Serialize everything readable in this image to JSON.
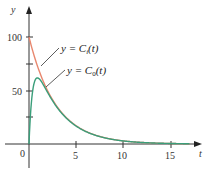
{
  "chart_data": {
    "type": "line",
    "title": "",
    "xlabel": "t",
    "ylabel": "y",
    "xlim": [
      0,
      17
    ],
    "ylim": [
      0,
      120
    ],
    "x_ticks": [
      0,
      5,
      10,
      15
    ],
    "y_ticks": [
      50,
      100
    ],
    "y_minor_ticks": [
      25,
      75
    ],
    "grid": false,
    "series": [
      {
        "name": "y = C_i(t)",
        "color": "#e8876e",
        "x": [
          0,
          1,
          2,
          3,
          4,
          5,
          6,
          8,
          10,
          12,
          15,
          17
        ],
        "values": [
          100,
          70,
          50,
          35,
          25,
          17,
          12,
          6,
          3,
          1.5,
          0.5,
          0.3
        ]
      },
      {
        "name": "y = C_0(t)",
        "color": "#3a9e7a",
        "x": [
          0,
          0.5,
          1,
          1.5,
          2,
          3,
          4,
          5,
          6,
          8,
          10,
          12,
          15,
          17
        ],
        "values": [
          0,
          50,
          60,
          55,
          47,
          33,
          24,
          16,
          12,
          6,
          3,
          1.5,
          0.5,
          0.3
        ]
      }
    ],
    "annotations": [
      "y = C_i(t)",
      "y = C_0(t)"
    ]
  },
  "labels": {
    "y_axis": "y",
    "x_axis": "t",
    "origin": "0",
    "y100": "100",
    "y50": "50",
    "x5": "5",
    "x10": "10",
    "x15": "15",
    "ci_prefix": "y = ",
    "ci_C": "C",
    "ci_sub": "i",
    "ci_suffix": "(t)",
    "c0_prefix": "y = ",
    "c0_C": "C",
    "c0_sub": "0",
    "c0_suffix": "(t)"
  }
}
